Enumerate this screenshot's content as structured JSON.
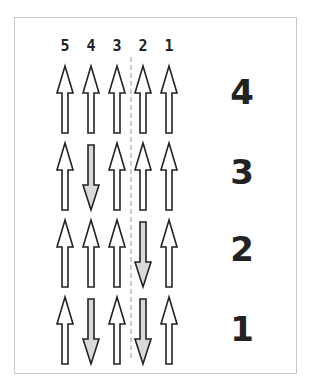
{
  "diagram": {
    "column_labels": [
      "5",
      "4",
      "3",
      "2",
      "1"
    ],
    "row_labels": [
      "4",
      "3",
      "2",
      "1"
    ],
    "rows": [
      {
        "label": "4",
        "arrows": [
          "up",
          "up",
          "up",
          "up",
          "up"
        ]
      },
      {
        "label": "3",
        "arrows": [
          "up",
          "down",
          "up",
          "up",
          "up"
        ]
      },
      {
        "label": "2",
        "arrows": [
          "up",
          "up",
          "up",
          "down",
          "up"
        ]
      },
      {
        "label": "1",
        "arrows": [
          "up",
          "down",
          "up",
          "down",
          "up"
        ]
      }
    ],
    "divider": {
      "style": "dashed",
      "between_columns": [
        "3",
        "2"
      ]
    },
    "colors": {
      "up_fill": "#ffffff",
      "down_fill": "#d9d9d9",
      "stroke": "#222222",
      "frame_border": "#c8c8c8",
      "divider": "#999999"
    }
  }
}
